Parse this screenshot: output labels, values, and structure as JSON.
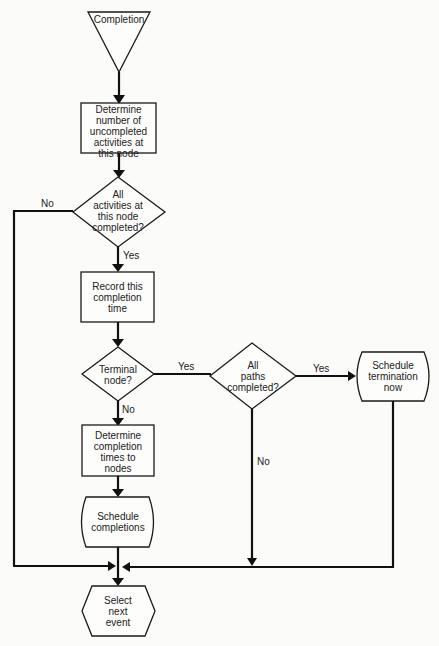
{
  "nodes": {
    "completion": "Completion",
    "determine_uncompleted": [
      "Determine",
      "number of",
      "uncompleted",
      "activities at",
      "this node"
    ],
    "all_activities": [
      "All",
      "activities at",
      "this node",
      "completed?"
    ],
    "record_time": [
      "Record this",
      "completion",
      "time"
    ],
    "terminal_node": [
      "Terminal",
      "node?"
    ],
    "all_paths": [
      "All",
      "paths",
      "completed?"
    ],
    "schedule_termination": [
      "Schedule",
      "termination",
      "now"
    ],
    "determine_times": [
      "Determine",
      "completion",
      "times to",
      "nodes"
    ],
    "schedule_completions": [
      "Schedule",
      "completions"
    ],
    "select_next": [
      "Select",
      "next",
      "event"
    ]
  },
  "edges": {
    "no_1": "No",
    "yes_1": "Yes",
    "yes_2": "Yes",
    "no_2": "No",
    "yes_3": "Yes",
    "no_3": "No"
  }
}
